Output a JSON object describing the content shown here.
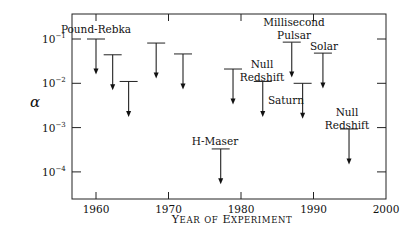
{
  "chart_data": {
    "type": "scatter",
    "subtype": "upper-limit-arrows",
    "title": "",
    "xlabel": "Year of Experiment",
    "ylabel": "α",
    "xscale": "linear",
    "yscale": "log",
    "xlim": [
      1956.7,
      2000
    ],
    "ylim_log10": [
      -4.62,
      -0.55
    ],
    "x_ticks": [
      1960,
      1970,
      1980,
      1990,
      2000
    ],
    "x_tick_labels": [
      "1960",
      "1970",
      "1980",
      "1990",
      "2000"
    ],
    "y_ticks": [
      0.1,
      0.01,
      0.001,
      0.0001
    ],
    "y_tick_labels": [
      {
        "base": "10",
        "exp": "−1"
      },
      {
        "base": "10",
        "exp": "−2"
      },
      {
        "base": "10",
        "exp": "−3"
      },
      {
        "base": "10",
        "exp": "−4"
      }
    ],
    "grid": false,
    "legend": null,
    "series": [
      {
        "name": "Upper limits on α",
        "points": [
          {
            "year": 1960.0,
            "alpha_upper": 0.1,
            "label": "Pound-Rebka"
          },
          {
            "year": 1962.3,
            "alpha_upper": 0.044,
            "label": ""
          },
          {
            "year": 1964.5,
            "alpha_upper": 0.011,
            "label": ""
          },
          {
            "year": 1968.3,
            "alpha_upper": 0.081,
            "label": ""
          },
          {
            "year": 1972.0,
            "alpha_upper": 0.046,
            "label": ""
          },
          {
            "year": 1978.9,
            "alpha_upper": 0.021,
            "label": ""
          },
          {
            "year": 1977.2,
            "alpha_upper": 0.00033,
            "label": "H-Maser"
          },
          {
            "year": 1983.0,
            "alpha_upper": 0.011,
            "label": "Null Redshift"
          },
          {
            "year": 1987.0,
            "alpha_upper": 0.085,
            "label": "Millisecond Pulsar"
          },
          {
            "year": 1988.5,
            "alpha_upper": 0.01,
            "label": "Saturn"
          },
          {
            "year": 1991.3,
            "alpha_upper": 0.048,
            "label": "Solar"
          },
          {
            "year": 1994.9,
            "alpha_upper": 0.00093,
            "label": "Null Redshift"
          }
        ]
      }
    ],
    "annotations": [
      {
        "lines": [
          "Pound-Rebka"
        ],
        "x": 96,
        "y": 33,
        "anchor": "middle"
      },
      {
        "lines": [
          "H-Maser"
        ],
        "x": 215,
        "y": 145,
        "anchor": "middle"
      },
      {
        "lines": [
          "Null",
          "Redshift"
        ],
        "x": 262,
        "y": 68,
        "anchor": "middle"
      },
      {
        "lines": [
          "Millisecond",
          "Pulsar"
        ],
        "x": 294,
        "y": 26,
        "anchor": "middle"
      },
      {
        "lines": [
          "Saturn"
        ],
        "x": 286,
        "y": 104,
        "anchor": "middle"
      },
      {
        "lines": [
          "Solar"
        ],
        "x": 324,
        "y": 50,
        "anchor": "middle"
      },
      {
        "lines": [
          "Null",
          "Redshift"
        ],
        "x": 347,
        "y": 116,
        "anchor": "middle"
      }
    ],
    "arrow_length_decades": 0.8
  },
  "layout": {
    "plot": {
      "left": 72,
      "top": 14,
      "right": 386,
      "bottom": 199
    },
    "x_ref": {
      "year_a": 1960,
      "px_a": 96,
      "year_b": 2000,
      "px_b": 386
    },
    "y_ref": {
      "log_a": -1,
      "px_a": 39,
      "px_per_decade": 44.3
    }
  }
}
